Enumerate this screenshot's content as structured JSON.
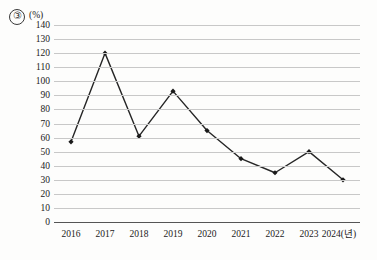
{
  "figure": {
    "number_marker": "③",
    "unit_label": "(%)"
  },
  "chart_data": {
    "type": "line",
    "title": "",
    "subtitle": "",
    "xlabel": "",
    "ylabel": "(%)",
    "categories": [
      "2016",
      "2017",
      "2018",
      "2019",
      "2020",
      "2021",
      "2022",
      "2023",
      "2024"
    ],
    "x_tick_labels": [
      "2016",
      "2017",
      "2018",
      "2019",
      "2020",
      "2021",
      "2022",
      "2023",
      "2024(년)"
    ],
    "values": [
      57,
      120,
      61,
      93,
      65,
      45,
      35,
      50,
      30
    ],
    "series": [
      {
        "name": "",
        "values": [
          57,
          120,
          61,
          93,
          65,
          45,
          35,
          50,
          30
        ]
      }
    ],
    "ylim": [
      0,
      140
    ],
    "y_tick_step": 10,
    "y_tick_labels": [
      "140",
      "130",
      "120",
      "110",
      "100",
      "90",
      "80",
      "70",
      "60",
      "50",
      "40",
      "30",
      "20",
      "10",
      "0"
    ],
    "grid": true,
    "legend": "none",
    "line_color": "#262626",
    "marker_color": "#1a1a1a",
    "marker_shape": "diamond",
    "gridline_color": "#c8c8c8",
    "axis_color": "#555555"
  }
}
